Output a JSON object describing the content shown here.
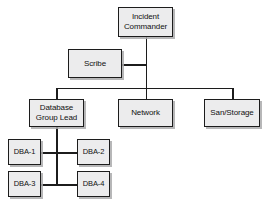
{
  "diagram": {
    "type": "org-chart",
    "colors": {
      "node_fill": "#ececed",
      "node_border": "#1c1c1c",
      "connector": "#1c1c1c",
      "shadow": "#aaaaac",
      "background": "#ffffff"
    },
    "nodes": [
      {
        "id": "incident-commander",
        "label": "Incident\nCommander",
        "level": 0
      },
      {
        "id": "scribe",
        "label": "Scribe",
        "level": 1
      },
      {
        "id": "database-group-lead",
        "label": "Database\nGroup Lead",
        "level": 2
      },
      {
        "id": "network",
        "label": "Network",
        "level": 2
      },
      {
        "id": "san-storage",
        "label": "San/Storage",
        "level": 2
      },
      {
        "id": "dba-1",
        "label": "DBA-1",
        "level": 3
      },
      {
        "id": "dba-2",
        "label": "DBA-2",
        "level": 3
      },
      {
        "id": "dba-3",
        "label": "DBA-3",
        "level": 3
      },
      {
        "id": "dba-4",
        "label": "DBA-4",
        "level": 3
      }
    ],
    "edges": [
      {
        "from": "incident-commander",
        "to": "scribe"
      },
      {
        "from": "incident-commander",
        "to": "database-group-lead"
      },
      {
        "from": "incident-commander",
        "to": "network"
      },
      {
        "from": "incident-commander",
        "to": "san-storage"
      },
      {
        "from": "database-group-lead",
        "to": "dba-1"
      },
      {
        "from": "database-group-lead",
        "to": "dba-2"
      },
      {
        "from": "database-group-lead",
        "to": "dba-3"
      },
      {
        "from": "database-group-lead",
        "to": "dba-4"
      }
    ]
  }
}
